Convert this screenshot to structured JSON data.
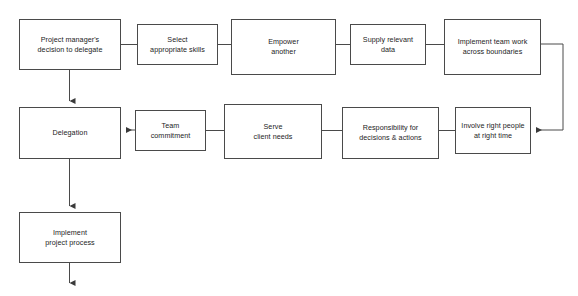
{
  "diagram": {
    "type": "flowchart",
    "orientation": "serpentine-horizontal",
    "background_color": "#ffffff",
    "box_border_color": "#4a4a4a",
    "connector_color": "#4a4a4a",
    "text_color": "#1c1c1c",
    "nodes": [
      {
        "id": "project-manager-decision",
        "label": "Project manager's\ndecision to delegate",
        "row": "top",
        "x": 19,
        "y": 19,
        "w": 102,
        "h": 51
      },
      {
        "id": "select-appropriate-skills",
        "label": "Select\nappropriate skills",
        "row": "top",
        "x": 137,
        "y": 24,
        "w": 81,
        "h": 41
      },
      {
        "id": "empower-another",
        "label": "Empower\nanother",
        "row": "top",
        "x": 231,
        "y": 19,
        "w": 105,
        "h": 56
      },
      {
        "id": "supply-relevant-data",
        "label": "Supply relevant\ndata",
        "row": "top",
        "x": 350,
        "y": 24,
        "w": 76,
        "h": 41
      },
      {
        "id": "implement-team-work",
        "label": "Implement team work\nacross boundaries",
        "row": "top",
        "x": 444,
        "y": 19,
        "w": 97,
        "h": 56
      },
      {
        "id": "delegation",
        "label": "Delegation",
        "row": "middle",
        "x": 19,
        "y": 107,
        "w": 102,
        "h": 52
      },
      {
        "id": "team-commitment",
        "label": "Team\ncommitment",
        "row": "middle",
        "x": 135,
        "y": 110,
        "w": 71,
        "h": 41
      },
      {
        "id": "serve-client-needs",
        "label": "Serve\nclient needs",
        "row": "middle",
        "x": 224,
        "y": 104,
        "w": 98,
        "h": 55
      },
      {
        "id": "responsibility-decisions-actions",
        "label": "Responsibility for\ndecisions & actions",
        "row": "middle",
        "x": 342,
        "y": 107,
        "w": 97,
        "h": 52
      },
      {
        "id": "involve-right-people",
        "label": "Involve right people\nat right time",
        "row": "middle",
        "x": 455,
        "y": 107,
        "w": 76,
        "h": 47
      },
      {
        "id": "implement-project-process",
        "label": "Implement\nproject process",
        "row": "bottom",
        "x": 19,
        "y": 212,
        "w": 102,
        "h": 51
      }
    ],
    "connectors": [
      {
        "id": "c1",
        "from": "project-manager-decision",
        "to": "select-appropriate-skills",
        "kind": "line",
        "arrow": false
      },
      {
        "id": "c2",
        "from": "select-appropriate-skills",
        "to": "empower-another",
        "kind": "line",
        "arrow": false
      },
      {
        "id": "c3",
        "from": "empower-another",
        "to": "supply-relevant-data",
        "kind": "line",
        "arrow": false
      },
      {
        "id": "c4",
        "from": "supply-relevant-data",
        "to": "implement-team-work",
        "kind": "line",
        "arrow": false
      },
      {
        "id": "c5",
        "from": "implement-team-work",
        "to": "involve-right-people",
        "kind": "elbow",
        "arrow": true
      },
      {
        "id": "c6",
        "from": "involve-right-people",
        "to": "responsibility-decisions-actions",
        "kind": "line",
        "arrow": false
      },
      {
        "id": "c7",
        "from": "responsibility-decisions-actions",
        "to": "serve-client-needs",
        "kind": "line",
        "arrow": false
      },
      {
        "id": "c8",
        "from": "serve-client-needs",
        "to": "team-commitment",
        "kind": "line",
        "arrow": false
      },
      {
        "id": "c9",
        "from": "team-commitment",
        "to": "delegation",
        "kind": "line",
        "arrow": true
      },
      {
        "id": "c10",
        "from": "project-manager-decision",
        "to": "delegation",
        "kind": "vertical",
        "arrow": true
      },
      {
        "id": "c11",
        "from": "delegation",
        "to": "implement-project-process",
        "kind": "vertical",
        "arrow": true
      },
      {
        "id": "c12",
        "from": "implement-project-process",
        "to": null,
        "kind": "vertical-open",
        "arrow": true
      }
    ]
  }
}
